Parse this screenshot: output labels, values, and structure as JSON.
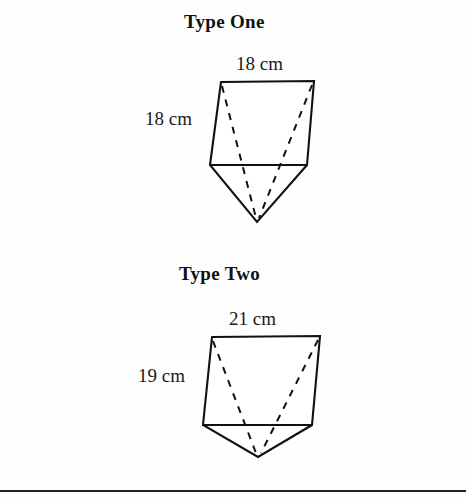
{
  "page": {
    "width": 466,
    "height": 499,
    "background_color": "#fefefe",
    "ink_color": "#111111",
    "clipped_header_text": "",
    "bottom_rule_color": "#222222"
  },
  "figures": [
    {
      "id": "type-one",
      "title": "Type One",
      "top_label": "18 cm",
      "side_label": "18 cm",
      "shape": "pentagonal prism with V-shaped bottom",
      "geometry": {
        "top_left": [
          221,
          82
        ],
        "top_right": [
          314,
          81
        ],
        "mid_left": [
          210,
          165
        ],
        "mid_right": [
          307,
          165
        ],
        "apex": [
          257,
          222
        ],
        "hidden_edges": [
          [
            [
              221,
              82
            ],
            [
              257,
              222
            ]
          ],
          [
            [
              314,
              81
            ],
            [
              257,
              222
            ]
          ]
        ]
      }
    },
    {
      "id": "type-two",
      "title": "Type Two",
      "top_label": "21 cm",
      "side_label": "19 cm",
      "shape": "pentagonal prism with V-shaped bottom",
      "geometry": {
        "top_left": [
          212,
          337
        ],
        "top_right": [
          320,
          336
        ],
        "mid_left": [
          203,
          425
        ],
        "mid_right": [
          312,
          425
        ],
        "apex": [
          258,
          457
        ],
        "hidden_edges": [
          [
            [
              212,
              337
            ],
            [
              258,
              457
            ]
          ],
          [
            [
              320,
              336
            ],
            [
              258,
              457
            ]
          ]
        ]
      }
    }
  ]
}
